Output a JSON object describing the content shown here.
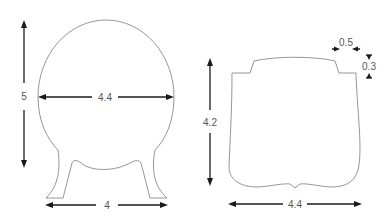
{
  "diagram": {
    "left_shape": {
      "name": "round-body-with-legs",
      "dimensions": {
        "height": "5",
        "width": "4.4",
        "base_width": "4"
      }
    },
    "right_shape": {
      "name": "notched-top-body",
      "dimensions": {
        "height": "4.2",
        "width": "4.4",
        "notch_width": "0.5",
        "notch_height": "0.3"
      }
    },
    "colors": {
      "outline": "#8a8a8a",
      "dimension_line": "#1a1a1a",
      "label": "#555555",
      "background": "#ffffff"
    }
  }
}
